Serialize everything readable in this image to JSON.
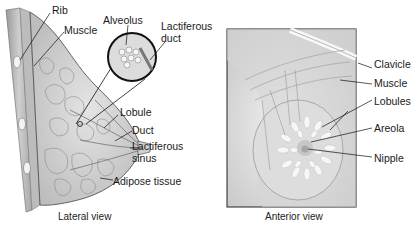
{
  "lateral_view": {
    "caption": "Lateral view",
    "labels": {
      "rib": "Rib",
      "muscle": "Muscle",
      "alveolus": "Alveolus",
      "lactiferous_duct_line1": "Lactiferous",
      "lactiferous_duct_line2": "duct",
      "lobule": "Lobule",
      "duct": "Duct",
      "lactiferous_sinus_line1": "Lactiferous",
      "lactiferous_sinus_line2": "sinus",
      "adipose_tissue": "Adipose tissue"
    }
  },
  "anterior_view": {
    "caption": "Anterior view",
    "labels": {
      "clavicle": "Clavicle",
      "muscle": "Muscle",
      "lobules": "Lobules",
      "areola": "Areola",
      "nipple": "Nipple"
    }
  },
  "colors": {
    "ink": "#1a1a1a",
    "tissue_fill": "#d8d8d8",
    "tissue_light": "#ececec",
    "frame": "#222222"
  }
}
